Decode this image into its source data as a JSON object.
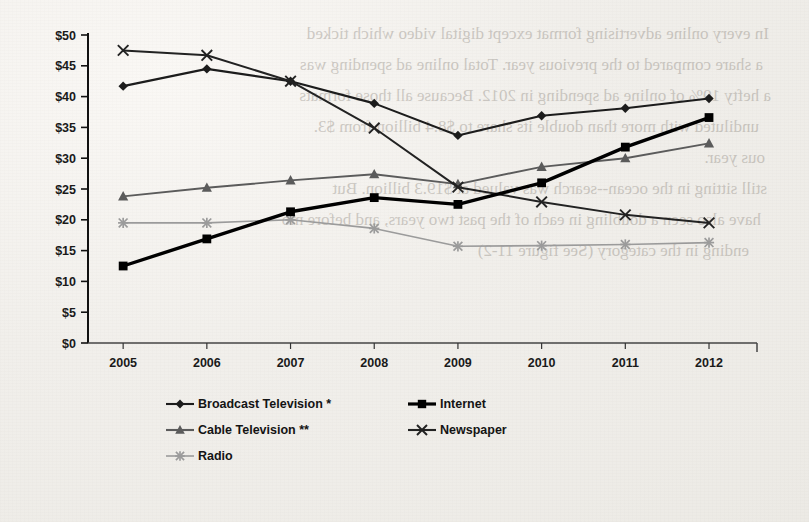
{
  "page": {
    "background_color": "#f2f0ec",
    "bleed_through_lines": [
      "In every online advertising format  except digital video which ticked",
      "a share compared to the previous year.  Total online ad spending was",
      "a hefty 19% of online ad spending in 2012.  Because all those formats",
      "undiluted with more than double its share to $8.4 billion from $3.",
      "ous year.",
      "still sitting in the ocean--search was valued at $19.3 billion. But",
      "have also seen a doubling in each of the past two years, and before mo",
      "ending in the category (See figure 11-2)"
    ]
  },
  "chart_data": {
    "type": "line",
    "title": "",
    "subtitle": "",
    "xlabel": "",
    "ylabel": "",
    "categories": [
      "2005",
      "2006",
      "2007",
      "2008",
      "2009",
      "2010",
      "2011",
      "2012"
    ],
    "ylim": [
      0,
      50
    ],
    "yticks": [
      0,
      5,
      10,
      15,
      20,
      25,
      30,
      35,
      40,
      45,
      50
    ],
    "ytick_labels": [
      "$0",
      "$5",
      "$10",
      "$15",
      "$20",
      "$25",
      "$30",
      "$35",
      "$40",
      "$45",
      "$50"
    ],
    "y_prefix": "$",
    "grid": false,
    "legend_position": "bottom",
    "units": "US$ billions",
    "series": [
      {
        "name": "Broadcast Television *",
        "marker": "diamond",
        "color": "#1c1c1c",
        "line_width": 2.1,
        "values": [
          41.7,
          44.5,
          42.5,
          38.9,
          33.7,
          36.9,
          38.1,
          39.7
        ]
      },
      {
        "name": "Internet",
        "marker": "square",
        "color": "#000000",
        "line_width": 3.4,
        "values": [
          12.5,
          16.9,
          21.3,
          23.6,
          22.5,
          26.0,
          31.8,
          36.6
        ]
      },
      {
        "name": "Cable Television **",
        "marker": "triangle",
        "color": "#5b5b5b",
        "line_width": 1.9,
        "values": [
          23.8,
          25.2,
          26.4,
          27.4,
          25.8,
          28.6,
          30.0,
          32.4
        ]
      },
      {
        "name": "Newspaper",
        "marker": "cross",
        "color": "#222222",
        "line_width": 2.0,
        "values": [
          47.5,
          46.7,
          42.5,
          34.9,
          25.3,
          22.9,
          20.8,
          19.5
        ]
      },
      {
        "name": "Radio",
        "marker": "starburst",
        "color": "#9b9b9b",
        "line_width": 1.6,
        "values": [
          19.5,
          19.5,
          20.0,
          18.6,
          15.7,
          15.8,
          16.0,
          16.3
        ]
      }
    ]
  },
  "legend": {
    "entries": [
      {
        "label": "Broadcast Television *",
        "marker": "diamond",
        "color": "#1c1c1c"
      },
      {
        "label": "Internet",
        "marker": "square",
        "color": "#000000"
      },
      {
        "label": "Cable Television **",
        "marker": "triangle",
        "color": "#5b5b5b"
      },
      {
        "label": "Newspaper",
        "marker": "cross",
        "color": "#222222"
      },
      {
        "label": "Radio",
        "marker": "starburst",
        "color": "#9b9b9b"
      }
    ]
  }
}
